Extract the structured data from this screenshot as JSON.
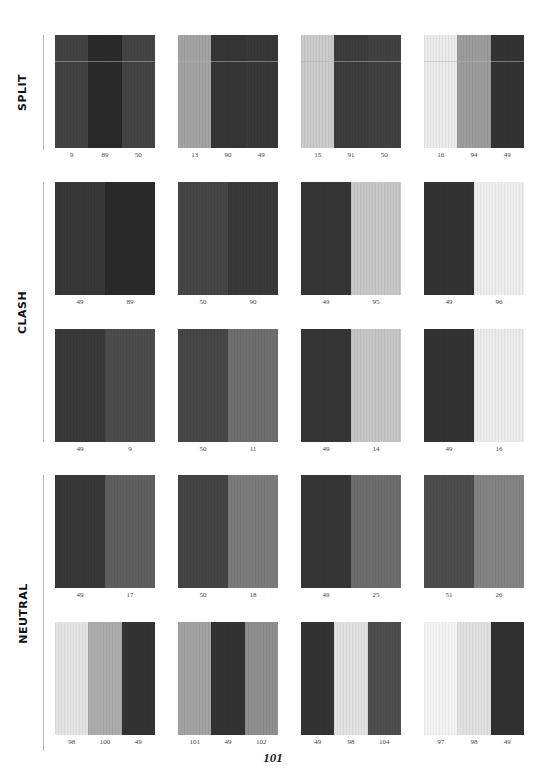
{
  "page": {
    "page_number": "101",
    "background": "#ffffff"
  },
  "sections": [
    {
      "label": "SPLIT",
      "rows": [
        [
          {
            "stripes": [
              {
                "code": "9",
                "color": "#424242"
              },
              {
                "code": "89",
                "color": "#2a2a2a"
              },
              {
                "code": "50",
                "color": "#444444"
              }
            ],
            "highlight_line": true
          },
          {
            "stripes": [
              {
                "code": "13",
                "color": "#a3a3a3"
              },
              {
                "code": "90",
                "color": "#353535"
              },
              {
                "code": "49",
                "color": "#383838"
              }
            ],
            "highlight_line": true
          },
          {
            "stripes": [
              {
                "code": "15",
                "color": "#cbcbcb"
              },
              {
                "code": "91",
                "color": "#3c3c3c"
              },
              {
                "code": "50",
                "color": "#414141"
              }
            ],
            "highlight_line": true
          },
          {
            "stripes": [
              {
                "code": "16",
                "color": "#ebebeb"
              },
              {
                "code": "94",
                "color": "#9c9c9c"
              },
              {
                "code": "49",
                "color": "#333333"
              }
            ],
            "highlight_line": true
          }
        ]
      ]
    },
    {
      "label": "CLASH",
      "rows": [
        [
          {
            "stripes": [
              {
                "code": "49",
                "color": "#383838"
              },
              {
                "code": "89",
                "color": "#2a2a2a"
              }
            ]
          },
          {
            "stripes": [
              {
                "code": "50",
                "color": "#464646"
              },
              {
                "code": "90",
                "color": "#393939"
              }
            ]
          },
          {
            "stripes": [
              {
                "code": "49",
                "color": "#353535"
              },
              {
                "code": "95",
                "color": "#c8c8c8"
              }
            ]
          },
          {
            "stripes": [
              {
                "code": "49",
                "color": "#333333"
              },
              {
                "code": "96",
                "color": "#eeeeee"
              }
            ]
          }
        ],
        [
          {
            "stripes": [
              {
                "code": "49",
                "color": "#393939"
              },
              {
                "code": "9",
                "color": "#4c4c4c"
              }
            ]
          },
          {
            "stripes": [
              {
                "code": "50",
                "color": "#474747"
              },
              {
                "code": "11",
                "color": "#6e6e6e"
              }
            ]
          },
          {
            "stripes": [
              {
                "code": "49",
                "color": "#353535"
              },
              {
                "code": "14",
                "color": "#c6c6c6"
              }
            ]
          },
          {
            "stripes": [
              {
                "code": "49",
                "color": "#333333"
              },
              {
                "code": "16",
                "color": "#ececec"
              }
            ]
          }
        ]
      ]
    },
    {
      "label": "NEUTRAL",
      "rows": [
        [
          {
            "stripes": [
              {
                "code": "49",
                "color": "#383838"
              },
              {
                "code": "17",
                "color": "#5f5f5f"
              }
            ]
          },
          {
            "stripes": [
              {
                "code": "50",
                "color": "#454545"
              },
              {
                "code": "18",
                "color": "#7b7b7b"
              }
            ]
          },
          {
            "stripes": [
              {
                "code": "49",
                "color": "#363636"
              },
              {
                "code": "25",
                "color": "#6d6d6d"
              }
            ]
          },
          {
            "stripes": [
              {
                "code": "51",
                "color": "#4d4d4d"
              },
              {
                "code": "26",
                "color": "#838383"
              }
            ]
          }
        ],
        [
          {
            "stripes": [
              {
                "code": "98",
                "color": "#e4e4e4"
              },
              {
                "code": "100",
                "color": "#acacac"
              },
              {
                "code": "49",
                "color": "#333333"
              }
            ]
          },
          {
            "stripes": [
              {
                "code": "101",
                "color": "#a3a3a3"
              },
              {
                "code": "49",
                "color": "#333333"
              },
              {
                "code": "102",
                "color": "#8f8f8f"
              }
            ]
          },
          {
            "stripes": [
              {
                "code": "49",
                "color": "#333333"
              },
              {
                "code": "98",
                "color": "#e2e2e2"
              },
              {
                "code": "104",
                "color": "#4e4e4e"
              }
            ]
          },
          {
            "stripes": [
              {
                "code": "97",
                "color": "#f3f3f3"
              },
              {
                "code": "98",
                "color": "#e1e1e1"
              },
              {
                "code": "49",
                "color": "#313131"
              }
            ]
          }
        ]
      ]
    }
  ]
}
